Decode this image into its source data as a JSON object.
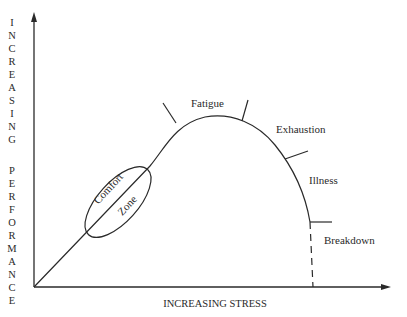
{
  "diagram": {
    "type": "stress-performance curve",
    "y_axis_label": "INCREASING PERFORMANCE",
    "y_axis_letters": [
      "I",
      "N",
      "C",
      "R",
      "E",
      "A",
      "S",
      "I",
      "N",
      "G",
      "",
      "P",
      "E",
      "R",
      "F",
      "O",
      "R",
      "M",
      "A",
      "N",
      "C",
      "E"
    ],
    "x_axis_label": "INCREASING STRESS",
    "zones": {
      "comfort_line1": "Comfort",
      "comfort_line2": "Zone",
      "fatigue": "Fatigue",
      "exhaustion": "Exhaustion",
      "illness": "Illness",
      "breakdown": "Breakdown"
    },
    "colors": {
      "ink": "#2a2a2a",
      "background": "#ffffff"
    }
  }
}
